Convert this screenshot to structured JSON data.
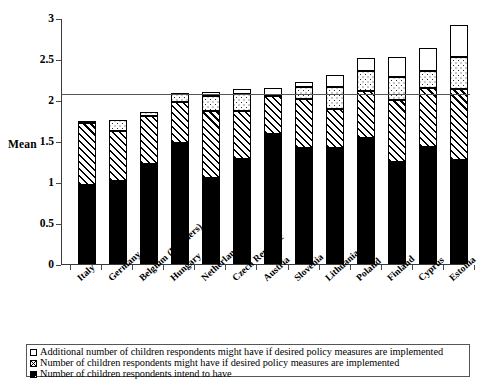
{
  "chart_data": {
    "type": "bar",
    "stacked": true,
    "title": "",
    "xlabel": "",
    "ylabel": "Mean",
    "ylim": [
      0,
      3
    ],
    "yticks": [
      "0",
      "0.5",
      "1",
      "1.5",
      "2",
      "2.5",
      "3"
    ],
    "grid": false,
    "legend_position": "bottom",
    "reference_line": {
      "value": 2.08,
      "label": ""
    },
    "categories": [
      "Italy",
      "Germany",
      "Belgium (Flanders)",
      "Hungary",
      "Netherlands",
      "Czech Republic",
      "Austria",
      "Slovenia",
      "Lithuania",
      "Poland",
      "Finland",
      "Cyprus",
      "Estonia"
    ],
    "series": [
      {
        "name": "Number of children respondents intend to have",
        "pattern": "solid-black",
        "values": [
          0.96,
          1.01,
          1.22,
          1.48,
          1.05,
          1.28,
          1.58,
          1.41,
          1.42,
          1.54,
          1.24,
          1.43,
          1.27
        ]
      },
      {
        "name": "Number of children respondents might have if desired policy measures are implemented",
        "pattern": "diagonal-hatch",
        "values": [
          0.76,
          0.61,
          0.58,
          0.49,
          0.81,
          0.58,
          0.47,
          0.6,
          0.47,
          0.57,
          0.76,
          0.72,
          0.87
        ]
      },
      {
        "name": "Additional number of children respondents might have if desired policy measures are implemented",
        "pattern": "dotted",
        "values": [
          0.02,
          0.14,
          0.05,
          0.1,
          0.19,
          0.21,
          0.0,
          0.15,
          0.27,
          0.24,
          0.28,
          0.2,
          0.39
        ]
      },
      {
        "name": "Additional (open top)",
        "pattern": "open-white",
        "values": [
          0.0,
          0.0,
          0.0,
          0.02,
          0.05,
          0.06,
          0.1,
          0.06,
          0.15,
          0.16,
          0.24,
          0.28,
          0.38
        ]
      }
    ],
    "cumulative_totals": [
      1.74,
      1.76,
      1.85,
      2.09,
      2.1,
      2.13,
      2.15,
      2.22,
      2.31,
      2.51,
      2.52,
      2.63,
      2.91
    ]
  },
  "axis": {
    "y_title": "Mean",
    "ticks": [
      "3",
      "2.5",
      "2",
      "1.5",
      "1",
      "0.5",
      "0"
    ]
  },
  "legend": {
    "items": [
      {
        "swatch": "open-square-swatch",
        "label": "Additional number of children respondents might have if desired policy measures are implemented"
      },
      {
        "swatch": "crossed-square-swatch",
        "label": "Number of children respondents might have if desired policy measures are implemented"
      },
      {
        "swatch": "filled-square-swatch",
        "label": "Number of children respondents intend to have"
      }
    ]
  }
}
